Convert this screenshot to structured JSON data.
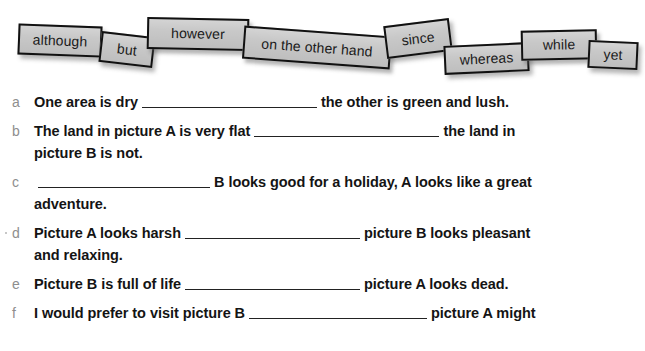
{
  "page": {
    "background_color": "#ffffff",
    "text_color": "#141414",
    "marker_color": "#8e8e8e"
  },
  "tile_bank": {
    "tile_fill_color": "#c8c8c8",
    "tile_border_color": "#111111",
    "tiles": [
      {
        "label": "although"
      },
      {
        "label": "but"
      },
      {
        "label": "however"
      },
      {
        "label": "on the other hand"
      },
      {
        "label": "since"
      },
      {
        "label": "whereas"
      },
      {
        "label": "while"
      },
      {
        "label": "yet"
      }
    ]
  },
  "questions": [
    {
      "marker": "a",
      "before": "One area is dry",
      "after": "the other is green and lush.",
      "second_line": ""
    },
    {
      "marker": "b",
      "before": "The land in picture A is very flat",
      "after": "the land in",
      "second_line": "picture B is not."
    },
    {
      "marker": "c",
      "before": "",
      "after": "B looks good for a holiday, A looks like a great",
      "second_line": "adventure."
    },
    {
      "marker": "d",
      "before": "Picture A looks harsh",
      "after": "picture B looks pleasant",
      "second_line": "and relaxing."
    },
    {
      "marker": "e",
      "before": "Picture B is full of life",
      "after": "picture A looks dead.",
      "second_line": ""
    },
    {
      "marker": "f",
      "before": "I would prefer to visit picture B",
      "after": "picture A might",
      "second_line": ""
    }
  ]
}
